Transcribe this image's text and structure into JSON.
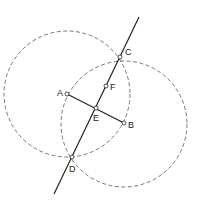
{
  "diagram": {
    "colors": {
      "stroke": "#222222",
      "dashed": "#555555",
      "background": "#ffffff"
    },
    "circles": [
      {
        "name": "circle-A",
        "cx": 67,
        "cy": 94,
        "r": 63
      },
      {
        "name": "circle-B",
        "cx": 124,
        "cy": 124,
        "r": 63
      }
    ],
    "line": {
      "x1": 139,
      "y1": 17,
      "x2": 54,
      "y2": 194
    },
    "segment": {
      "from": "A",
      "to": "B"
    },
    "points": {
      "A": {
        "label": "A",
        "x": 67,
        "y": 94,
        "lx": 57,
        "ly": 96
      },
      "B": {
        "label": "B",
        "x": 124,
        "y": 123,
        "lx": 128,
        "ly": 128
      },
      "C": {
        "label": "C",
        "x": 120,
        "y": 57,
        "lx": 125,
        "ly": 55
      },
      "D": {
        "label": "D",
        "x": 72,
        "y": 157,
        "lx": 69,
        "ly": 172
      },
      "E": {
        "label": "E",
        "x": 96,
        "y": 108,
        "lx": 93,
        "ly": 121
      },
      "F": {
        "label": "F",
        "x": 106,
        "y": 86,
        "lx": 110,
        "ly": 90
      }
    }
  }
}
